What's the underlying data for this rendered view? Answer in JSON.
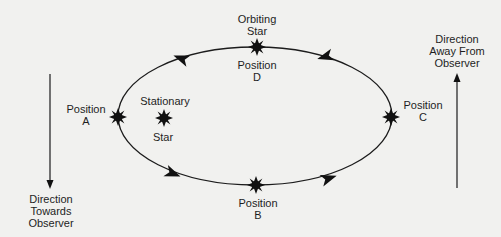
{
  "diagram": {
    "type": "binary-star-orbit",
    "orbit_direction": "counterclockwise (A -> B -> C -> D)",
    "colors": {
      "background": "#f1f1ef",
      "ink": "#1c1c1c"
    }
  },
  "labels": {
    "orbiting_star": "Orbiting\nStar",
    "position_d": "Position\nD",
    "position_a": "Position\nA",
    "stationary_star": "Stationary",
    "stationary_star_2": "Star",
    "position_c": "Position\nC",
    "position_b": "Position\nB",
    "direction_away": "Direction\nAway From\nObserver",
    "direction_towards": "Direction\nTowards\nObserver"
  },
  "icons": {
    "star_marker": "starburst-icon",
    "orbit_arrow": "arrowhead-icon"
  }
}
